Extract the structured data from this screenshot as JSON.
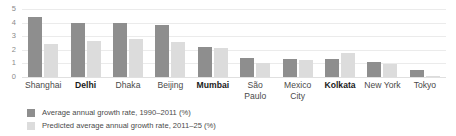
{
  "chart_data": {
    "type": "bar",
    "title": "",
    "xlabel": "",
    "ylabel": "",
    "ylim": [
      0,
      5
    ],
    "yticks": [
      5,
      4,
      3,
      2,
      1,
      0
    ],
    "grid": true,
    "legend_position": "bottom-left",
    "categories": [
      "Shanghai",
      "Delhi",
      "Dhaka",
      "Beijing",
      "Mumbai",
      "São\nPaulo",
      "Mexico\nCity",
      "Kolkata",
      "New York",
      "Tokyo"
    ],
    "category_emphasis": [
      false,
      true,
      false,
      false,
      true,
      false,
      false,
      true,
      false,
      false
    ],
    "series": [
      {
        "name": "Average annual growth rate, 1990–2011 (%)",
        "color": "#8e8e8e",
        "values": [
          4.4,
          3.95,
          3.95,
          3.85,
          2.2,
          1.4,
          1.35,
          1.3,
          1.1,
          0.55
        ]
      },
      {
        "name": "Predicted average annual growth rate, 2011–25 (%)",
        "color": "#dcdcdc",
        "values": [
          2.4,
          2.65,
          2.8,
          2.6,
          2.1,
          1.0,
          1.25,
          1.8,
          0.95,
          0.05
        ]
      }
    ]
  }
}
